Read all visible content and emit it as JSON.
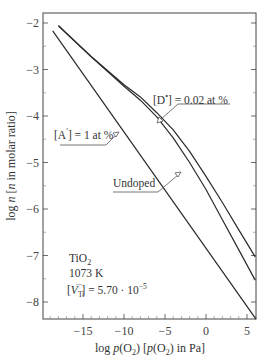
{
  "chart_data": {
    "type": "line",
    "title": "",
    "xlabel": "log p(O2) [p(O2) in Pa]",
    "ylabel": "log n [n in molar ratio]",
    "xlim": [
      -20,
      6
    ],
    "ylim": [
      -8.35,
      -1.8
    ],
    "xticks": [
      -15,
      -10,
      -5,
      0,
      5
    ],
    "yticks": [
      -2,
      -3,
      -4,
      -5,
      -6,
      -7,
      -8
    ],
    "grid": false,
    "series": [
      {
        "name": "[D•] = 0.02 at %",
        "x": [
          -18,
          -14,
          -10,
          -8,
          -6,
          -4,
          -2,
          0,
          2,
          4,
          6
        ],
        "y": [
          -2.06,
          -2.72,
          -3.33,
          -3.59,
          -3.93,
          -4.3,
          -4.76,
          -5.3,
          -5.86,
          -6.45,
          -7.03
        ]
      },
      {
        "name": "Undoped",
        "x": [
          -18,
          -14,
          -10,
          -8,
          -6,
          -4,
          -2,
          0,
          2,
          4,
          6
        ],
        "y": [
          -2.06,
          -2.73,
          -3.36,
          -3.66,
          -4.02,
          -4.47,
          -5.0,
          -5.58,
          -6.23,
          -6.88,
          -7.53
        ]
      },
      {
        "name": "[A′] = 1 at %",
        "x": [
          -18.7,
          6.1
        ],
        "y": [
          -2.17,
          -8.37
        ]
      }
    ],
    "annotations": [
      {
        "label_parts": [
          "[D",
          "•",
          "] = 0.02 at %"
        ],
        "text": "[D•] = 0.02 at %"
      },
      {
        "label_parts": [
          "[A",
          "′",
          "] = 1 at %"
        ],
        "text": "[A′] = 1 at %"
      },
      {
        "text": "Undoped"
      }
    ],
    "info_box": {
      "line1_main": "TiO",
      "line1_sub": "2",
      "line2": "1073 K",
      "line3_open": "[",
      "line3_var": "V",
      "line3_sub": "Ti",
      "line3_sup": "′′′′",
      "line3_rest": "] = 5.70 · 10",
      "line3_exp": "−5"
    },
    "axis_labels": {
      "x_prefix": "log ",
      "x_p": "p",
      "x_o": "(O",
      "x_sub": "2",
      "x_mid": ") [",
      "x_p2": "p",
      "x_o2": "(O",
      "x_sub2": "2",
      "x_end": ") in Pa]",
      "y_prefix": "log ",
      "y_n": "n",
      "y_open": " [",
      "y_n2": "n",
      "y_end": " in molar ratio]"
    },
    "tick_labels": {
      "x": [
        "−15",
        "−10",
        "−5",
        "0",
        "5"
      ],
      "y": [
        "−2",
        "−3",
        "−4",
        "−5",
        "−6",
        "−7",
        "−8"
      ]
    },
    "colors": {
      "line": "#2a2a2a",
      "frame": "#444444",
      "text": "#333333"
    }
  }
}
